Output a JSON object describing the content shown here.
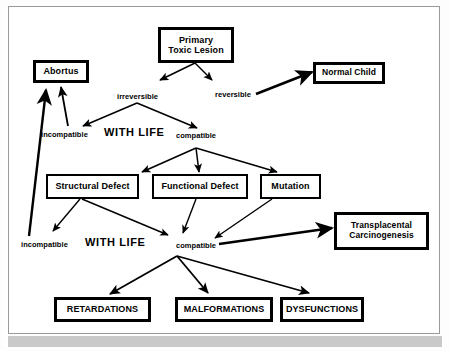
{
  "diagram": {
    "colors": {
      "line": "#000000",
      "box_border": "#000000",
      "frame": "#9a9a9a",
      "background": "#ffffff"
    },
    "nodes": [
      {
        "id": "primary-toxic-lesion",
        "label_line1": "Primary",
        "label_line2": "Toxic Lesion",
        "border": "thick"
      },
      {
        "id": "abortus",
        "label_line1": "Abortus",
        "label_line2": "",
        "border": "thick"
      },
      {
        "id": "normal-child",
        "label_line1": "Normal Child",
        "label_line2": "",
        "border": "thick"
      },
      {
        "id": "structural-defect",
        "label_line1": "Structural Defect",
        "label_line2": "",
        "border": "thin"
      },
      {
        "id": "functional-defect",
        "label_line1": "Functional Defect",
        "label_line2": "",
        "border": "thin"
      },
      {
        "id": "mutation",
        "label_line1": "Mutation",
        "label_line2": "",
        "border": "thin"
      },
      {
        "id": "transplacental-carcinogenesis",
        "label_line1": "Transplacental",
        "label_line2": "Carcinogenesis",
        "border": "thick"
      },
      {
        "id": "retardations",
        "label_line1": "RETARDATIONS",
        "label_line2": "",
        "border": "thick"
      },
      {
        "id": "malformations",
        "label_line1": "MALFORMATIONS",
        "label_line2": "",
        "border": "thick"
      },
      {
        "id": "dysfunctions",
        "label_line1": "DYSFUNCTIONS",
        "label_line2": "",
        "border": "thick"
      }
    ],
    "edge_labels": {
      "irreversible": "irreversible",
      "reversible": "reversible",
      "incompatible_1": "incompatible",
      "with_life_1": "WITH  LIFE",
      "compatible_1": "compatible",
      "incompatible_2": "incompatible",
      "with_life_2": "WITH  LIFE",
      "compatible_2": "compatible"
    }
  }
}
